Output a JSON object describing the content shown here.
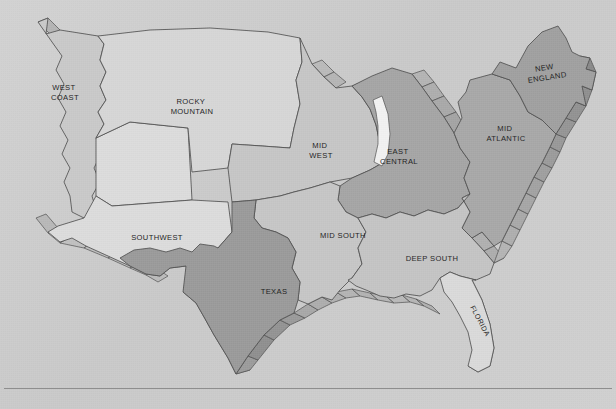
{
  "figure": {
    "name": "us-sales-regions-map",
    "type": "map",
    "background_color": "#cdcdcd",
    "outline_color": "#4a4a4a",
    "label_color": "#1d1d1d",
    "has_bottom_rule": true
  },
  "legend_note": "",
  "regions": [
    {
      "id": "west-coast",
      "label": "WEST COAST",
      "label_lines": [
        "WEST",
        "COAST"
      ],
      "fill": "#c9c9c9",
      "tone": "light",
      "label_x": 65,
      "label_y": 90,
      "rotation": 0
    },
    {
      "id": "rocky-mountain",
      "label": "ROCKY MOUNTAIN",
      "label_lines": [
        "ROCKY",
        "MOUNTAIN"
      ],
      "fill": "#d6d6d6",
      "tone": "lightest",
      "label_x": 192,
      "label_y": 104,
      "rotation": 0
    },
    {
      "id": "southwest",
      "label": "SOUTHWEST",
      "label_lines": [
        "SOUTHWEST"
      ],
      "fill": "#dcdcdc",
      "tone": "lightest",
      "label_x": 157,
      "label_y": 239,
      "rotation": 0
    },
    {
      "id": "mid-west",
      "label": "MID WEST",
      "label_lines": [
        "MID",
        "WEST"
      ],
      "fill": "#c6c6c6",
      "tone": "light",
      "label_x": 321,
      "label_y": 146,
      "rotation": 0
    },
    {
      "id": "east-central",
      "label": "EAST CENTRAL",
      "label_lines": [
        "EAST",
        "CENTRAL"
      ],
      "fill": "#a5a5a5",
      "tone": "dark",
      "label_x": 399,
      "label_y": 152,
      "rotation": 0
    },
    {
      "id": "mid-atlantic",
      "label": "MID ATLANTIC",
      "label_lines": [
        "MID",
        "ATLANTIC"
      ],
      "fill": "#a8a8a8",
      "tone": "dark",
      "label_x": 506,
      "label_y": 129,
      "rotation": 0
    },
    {
      "id": "new-england",
      "label": "NEW ENGLAND",
      "label_lines": [
        "NEW",
        "ENGLAND"
      ],
      "fill": "#a0a0a0",
      "tone": "dark",
      "label_x": 546,
      "label_y": 72,
      "rotation": -8
    },
    {
      "id": "mid-south",
      "label": "MID SOUTH",
      "label_lines": [
        "MID SOUTH"
      ],
      "fill": "#c6c6c6",
      "tone": "light",
      "label_x": 343,
      "label_y": 236,
      "rotation": 0
    },
    {
      "id": "deep-south",
      "label": "DEEP SOUTH",
      "label_lines": [
        "DEEP SOUTH"
      ],
      "fill": "#c4c4c4",
      "tone": "light",
      "label_x": 432,
      "label_y": 259,
      "rotation": 0
    },
    {
      "id": "texas",
      "label": "TEXAS",
      "label_lines": [
        "TEXAS"
      ],
      "fill": "#9a9a9a",
      "tone": "darkest",
      "label_x": 274,
      "label_y": 292,
      "rotation": 0
    },
    {
      "id": "florida",
      "label": "FLORIDA",
      "label_lines": [
        "FLORIDA"
      ],
      "fill": "#dadada",
      "tone": "lightest",
      "label_x": 478,
      "label_y": 320,
      "rotation": 62
    }
  ],
  "features": [
    {
      "id": "lake-michigan",
      "label": "",
      "fill": "#f2f2f2"
    }
  ],
  "labels": {
    "west_coast": "WEST",
    "west_coast_2": "COAST",
    "rocky_mountain": "ROCKY",
    "rocky_mountain_2": "MOUNTAIN",
    "southwest": "SOUTHWEST",
    "mid_west": "MID",
    "mid_west_2": "WEST",
    "east_central": "EAST",
    "east_central_2": "CENTRAL",
    "mid_atlantic": "MID",
    "mid_atlantic_2": "ATLANTIC",
    "new_england": "NEW",
    "new_england_2": "ENGLAND",
    "mid_south": "MID SOUTH",
    "deep_south": "DEEP SOUTH",
    "texas": "TEXAS",
    "florida": "FLORIDA"
  }
}
